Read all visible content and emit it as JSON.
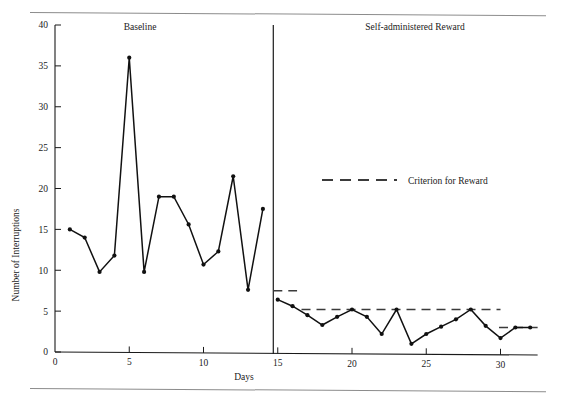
{
  "chart_data": {
    "type": "line",
    "title": "",
    "xlabel": "Days",
    "ylabel": "Number of Interruptions",
    "xlim": [
      0,
      32.5
    ],
    "ylim": [
      0,
      40
    ],
    "xticks": [
      0,
      5,
      10,
      15,
      20,
      25,
      30
    ],
    "yticks": [
      0,
      5,
      10,
      15,
      20,
      25,
      30,
      35,
      40
    ],
    "xtick_labels": [
      "0",
      "5",
      "10",
      "15",
      "20",
      "25",
      "30"
    ],
    "ytick_labels": [
      "0",
      "5",
      "10",
      "15",
      "20",
      "25",
      "30",
      "35",
      "40"
    ],
    "grid": false,
    "legend_position": "upper-right-inside",
    "phases": [
      {
        "name": "baseline",
        "label": "Baseline",
        "x_start": 0,
        "x_end": 14.7
      },
      {
        "name": "treatment",
        "label": "Self-administered Reward",
        "x_start": 14.7,
        "x_end": 32.5
      }
    ],
    "phase_divider_x": 14.7,
    "series": [
      {
        "name": "Baseline",
        "x": [
          1,
          2,
          3,
          4,
          5,
          6,
          7,
          8,
          9,
          10,
          11,
          12,
          13,
          14
        ],
        "values": [
          15.0,
          14.0,
          9.8,
          11.8,
          36.0,
          9.8,
          19.0,
          19.0,
          15.6,
          10.7,
          12.3,
          21.5,
          7.6,
          17.5
        ]
      },
      {
        "name": "Self-administered Reward",
        "x": [
          15,
          16,
          17,
          18,
          19,
          20,
          21,
          22,
          23,
          24,
          25,
          26,
          27,
          28,
          29,
          30,
          31,
          32
        ],
        "values": [
          6.4,
          5.6,
          4.5,
          3.3,
          4.3,
          5.2,
          4.3,
          2.2,
          5.2,
          1.0,
          2.2,
          3.1,
          4.0,
          5.2,
          3.2,
          1.7,
          3.0,
          3.0
        ]
      }
    ],
    "criterion_steps": [
      {
        "label": "step-1",
        "x_start": 14.7,
        "x_end": 16.3,
        "y": 7.5
      },
      {
        "label": "step-2",
        "x_start": 16.6,
        "x_end": 30.0,
        "y": 5.2
      },
      {
        "label": "step-3",
        "x_start": 29.9,
        "x_end": 32.5,
        "y": 3.0
      }
    ],
    "legend": [
      {
        "name": "criterion-for-reward",
        "label": "Criterion for Reward",
        "style": "dashed",
        "color": "#3b3b3b"
      }
    ]
  },
  "legend_text": {
    "criterion": "Criterion for Reward"
  }
}
